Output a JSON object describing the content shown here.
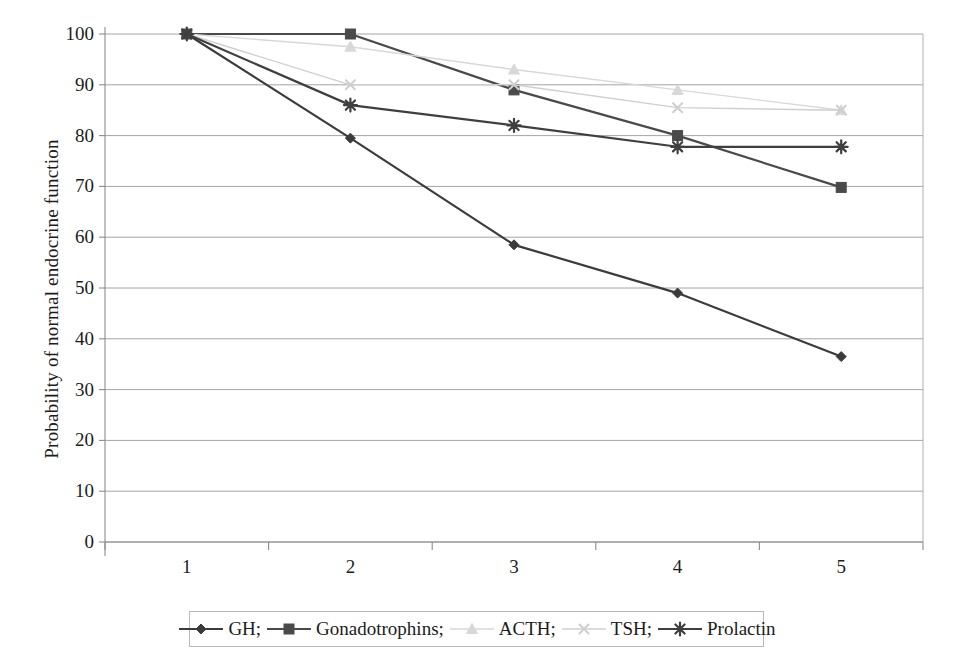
{
  "chart_data": {
    "type": "line",
    "title": "",
    "xlabel": "",
    "ylabel": "Probability of normal endocrine function",
    "categories": [
      "1",
      "2",
      "3",
      "4",
      "5"
    ],
    "x": [
      1,
      2,
      3,
      4,
      5
    ],
    "ylim": [
      0,
      100
    ],
    "ytick_labels": [
      "0",
      "10",
      "20",
      "30",
      "40",
      "50",
      "60",
      "70",
      "80",
      "90",
      "100"
    ],
    "yticks": [
      0,
      10,
      20,
      30,
      40,
      50,
      60,
      70,
      80,
      90,
      100
    ],
    "grid": true,
    "legend_position": "bottom",
    "series": [
      {
        "name": "GH;",
        "marker": "diamond",
        "color": "#3b3b3b",
        "values": [
          100,
          79.5,
          58.5,
          49,
          36.5
        ]
      },
      {
        "name": "Gonadotrophins;",
        "marker": "square",
        "color": "#4a4a4a",
        "values": [
          100,
          100,
          89,
          80,
          69.8
        ]
      },
      {
        "name": "ACTH;",
        "marker": "triangle",
        "color": "#d8d8d8",
        "values": [
          100,
          97.5,
          93,
          89,
          85
        ]
      },
      {
        "name": "TSH;",
        "marker": "x",
        "color": "#cfcfcf",
        "values": [
          100,
          90,
          90,
          85.5,
          85
        ]
      },
      {
        "name": "Prolactin",
        "marker": "asterisk",
        "color": "#3f3f3f",
        "values": [
          100,
          86,
          82,
          77.8,
          77.8
        ]
      }
    ]
  },
  "axis": {
    "y_title": "Probability of normal endocrine function"
  },
  "legend": {
    "items": [
      {
        "label": "GH;",
        "marker": "diamond",
        "color": "#3b3b3b"
      },
      {
        "label": "Gonadotrophins;",
        "marker": "square",
        "color": "#4a4a4a"
      },
      {
        "label": "ACTH;",
        "marker": "triangle",
        "color": "#d8d8d8"
      },
      {
        "label": "TSH;",
        "marker": "x",
        "color": "#cfcfcf"
      },
      {
        "label": "Prolactin",
        "marker": "asterisk",
        "color": "#3f3f3f"
      }
    ]
  },
  "colors": {
    "grid": "#9a9a9a",
    "axis": "#8c8c8c",
    "plot_border": "#b0b0b0",
    "text": "#1c1c1c",
    "background": "#ffffff"
  }
}
